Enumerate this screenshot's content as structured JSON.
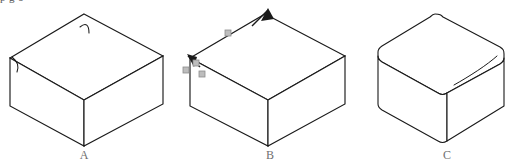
{
  "figure": {
    "caption_partial": "p                        g                        o",
    "background_color": "#ffffff",
    "stroke_color": "#1a1a1a",
    "thin_stroke_color": "#3a3a3a",
    "marker_color": "#9a9a9a",
    "label_color": "#6f6f6f",
    "width": 527,
    "height": 164
  },
  "shapes": [
    {
      "id": "A",
      "label": "A",
      "label_x": 84,
      "label_y": 159,
      "description": "isometric box with sharp edges and two small fillet arc hints",
      "top_face": "M 84,14 L 163,56 L 84,100 L 10,58 Z",
      "left_face": "M 10,58 L 84,100 L 84,146 L 10,106 Z",
      "right_face": "M 84,100 L 163,56 L 163,104 L 84,146 Z",
      "arc_top": "M 80,27 C 86,22 89,25 89,33",
      "arc_left": "M 12,57 C 18,62 19,66 17,72"
    },
    {
      "id": "B",
      "label": "B",
      "label_x": 270,
      "label_y": 159,
      "description": "isometric box with selection markers and direction arrows on two top edges",
      "top_face": "M 265,14 L 345,56 L 268,100 L 190,58 Z",
      "left_face": "M 190,58 L 268,100 L 268,146 L 190,106 Z",
      "right_face": "M 268,100 L 345,56 L 345,104 L 268,146 Z",
      "arrow_top": "M 252,26 L 268,10",
      "arrow_left": "M 200,67 L 188,56",
      "edge_markers": [
        {
          "x": 228,
          "y": 33
        },
        {
          "x": 196,
          "y": 63
        },
        {
          "x": 186,
          "y": 70
        },
        {
          "x": 202,
          "y": 74
        }
      ]
    },
    {
      "id": "C",
      "label": "C",
      "label_x": 447,
      "label_y": 159,
      "description": "isometric box with rounded (filleted) vertical edges and a fillet tangent line on the top face",
      "top_face": "M 435,14 C 440,14 441,15 443,17 L 500,47 C 503,49 504,50 504,54 L 504,58 C 504,61 503,62 500,64 L 447,93 C 444,95 441,95 438,93 L 382,62 C 379,60 378,59 378,56 L 378,52 C 378,49 379,48 382,46 L 430,17 C 432,15 433,14 435,14 Z",
      "left_face": "M 378,56 L 378,104 C 378,107 379,108 382,110 L 438,141 C 441,143 444,143 447,141 L 447,93 C 444,95 441,95 438,93 L 382,62 C 379,60 378,59 378,56 Z",
      "right_face": "M 447,93 L 447,141 L 504,106 L 504,58 C 504,61 503,62 500,64 Z",
      "fillet_line": "M 454,85 C 470,76 487,65 497,56"
    }
  ]
}
